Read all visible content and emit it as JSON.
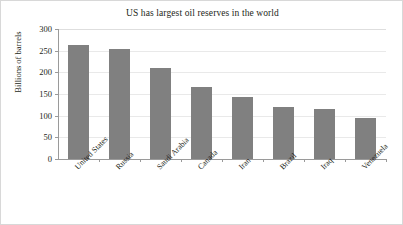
{
  "chart_data": {
    "type": "bar",
    "title": "US has largest oil reserves in the world",
    "xlabel": "",
    "ylabel": "Billions of barrels",
    "categories": [
      "United States",
      "Russia",
      "Saudi Arabia",
      "Canada",
      "Iran",
      "Brazil",
      "Iraq",
      "Venezuela"
    ],
    "values": [
      262,
      255,
      211,
      167,
      143,
      120,
      116,
      95
    ],
    "ylim": [
      0,
      300
    ],
    "yticks": [
      0,
      50,
      100,
      150,
      200,
      250,
      300
    ],
    "ytick_labels": [
      "0",
      "50",
      "100",
      "150",
      "200",
      "250",
      "300"
    ],
    "grid": true,
    "legend": false,
    "series": [
      {
        "name": "Oil reserves",
        "values": [
          262,
          255,
          211,
          167,
          143,
          120,
          116,
          95
        ]
      }
    ],
    "bar_color": "#808080",
    "gridline_color": "#e9e9e9",
    "axis_color": "#9a9a9a",
    "text_color": "#231f20"
  }
}
